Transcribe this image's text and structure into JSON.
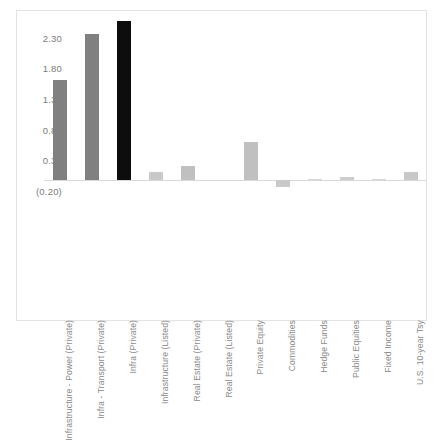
{
  "chart_data": {
    "type": "bar",
    "title": "",
    "subtitle": "",
    "xlabel": "",
    "ylabel": "",
    "grid": false,
    "legend": "none",
    "ylim": [
      -0.2,
      2.7
    ],
    "yticks": [
      "(0.20)",
      "0.30",
      "0.80",
      "1.30",
      "1.80",
      "2.30"
    ],
    "ytick_values": [
      -0.2,
      0.3,
      0.8,
      1.3,
      1.8,
      2.3
    ],
    "categories": [
      "Infrastructure - Power (Private)",
      "Infra - Transport (Private)",
      "Infra (Private)",
      "Infrastructure (Listed)",
      "Real Estate (Private)",
      "Real Estate (Listed)",
      "Private Equity",
      "Commodities",
      "Hedge Funds",
      "Public Equities",
      "Fixed Income",
      "U.S. 10-year Tsy"
    ],
    "values": [
      1.62,
      2.37,
      2.58,
      0.12,
      0.22,
      0.0,
      0.62,
      -0.12,
      0.01,
      0.05,
      0.01,
      0.12
    ],
    "colors": [
      "#808080",
      "#808080",
      "#0d0d0d",
      "#c9c9c9",
      "#c0c0c0",
      "#cccccc",
      "#c0c0c0",
      "#c9c9c9",
      "#d5d5d5",
      "#cdcdcd",
      "#d5d5d5",
      "#c9c9c9"
    ]
  },
  "style": {
    "frame_color": "#e3e3e3",
    "axis_line_color": "#d9d9d9",
    "tick_text_color": "#7b7b7b",
    "category_text_color": "#8a8a8a",
    "background": "#ffffff"
  }
}
